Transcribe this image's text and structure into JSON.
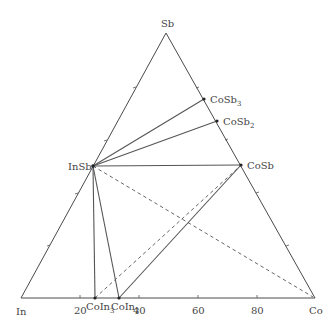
{
  "diagram": {
    "type": "ternary-phase-diagram",
    "vertices": {
      "top": {
        "label": "Sb",
        "x": 166,
        "y": 33
      },
      "left": {
        "label": "In",
        "x": 21,
        "y": 298
      },
      "right": {
        "label": "Co",
        "x": 315,
        "y": 298
      }
    },
    "bottom_axis_ticks": [
      {
        "label": "20",
        "x": 80
      },
      {
        "label": "40",
        "x": 139
      },
      {
        "label": "60",
        "x": 198
      },
      {
        "label": "80",
        "x": 257
      }
    ],
    "phases": [
      {
        "label": "InSb",
        "base": "InSb",
        "sub": "",
        "x": 93,
        "y": 166
      },
      {
        "label": "CoSb3",
        "base": "CoSb",
        "sub": "3",
        "x": 204,
        "y": 99
      },
      {
        "label": "CoSb2",
        "base": "CoSb",
        "sub": "2",
        "x": 217,
        "y": 121
      },
      {
        "label": "CoSb",
        "base": "CoSb",
        "sub": "",
        "x": 241,
        "y": 165
      },
      {
        "label": "CoIn3",
        "base": "CoIn",
        "sub": "3",
        "x": 95,
        "y": 298
      },
      {
        "label": "CoIn2",
        "base": "CoIn",
        "sub": "2",
        "x": 119,
        "y": 298
      }
    ],
    "solid_tie_lines": [
      [
        "InSb",
        "CoSb3"
      ],
      [
        "InSb",
        "CoSb2"
      ],
      [
        "InSb",
        "CoSb"
      ],
      [
        "InSb",
        "CoIn3"
      ],
      [
        "InSb",
        "CoIn2"
      ],
      [
        "CoIn2",
        "CoSb"
      ]
    ],
    "dashed_tie_lines": [
      [
        "InSb",
        "Co"
      ],
      [
        "CoIn3",
        "CoSb"
      ]
    ]
  }
}
